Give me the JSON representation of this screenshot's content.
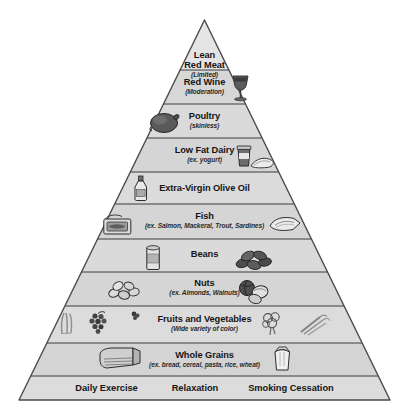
{
  "diagram": {
    "name": "Mediterranean-style healthy eating pyramid",
    "shape": "pyramid",
    "tier_count": 11,
    "colors": {
      "tier_fill": "#d6d6d6",
      "tier_fill_light": "#dcdcdc",
      "apex_fill": "#e4e4e4",
      "outline": "#4a4a4a",
      "divider": "#3c3c3c",
      "text": "#161616",
      "background": "#ffffff"
    }
  },
  "tiers": [
    {
      "index": 0,
      "title": "Lean\nRed Meat",
      "title_line1": "Lean",
      "title_line2": "Red Meat",
      "subtitle": "(Limited)",
      "icons": []
    },
    {
      "index": 1,
      "title": "Red Wine",
      "subtitle": "(Moderation)",
      "icons": [
        "wine-glass-icon"
      ]
    },
    {
      "index": 2,
      "title": "Poultry",
      "subtitle": "(skinless)",
      "icons": [
        "roast-chicken-icon"
      ]
    },
    {
      "index": 3,
      "title": "Low Fat Dairy",
      "subtitle": "(ex. yogurt)",
      "icons": [
        "yogurt-cup-icon",
        "cheese-wedge-icon"
      ]
    },
    {
      "index": 4,
      "title": "Extra-Virgin Olive Oil",
      "subtitle": "",
      "icons": [
        "olive-oil-bottle-icon"
      ]
    },
    {
      "index": 5,
      "title": "Fish",
      "subtitle": "(ex. Salmon, Mackeral, Trout, Sardines)",
      "icons": [
        "sardine-tin-icon",
        "fish-fillet-icon"
      ]
    },
    {
      "index": 6,
      "title": "Beans",
      "subtitle": "",
      "icons": [
        "bean-can-icon",
        "beans-pile-icon"
      ]
    },
    {
      "index": 7,
      "title": "Nuts",
      "subtitle": "(ex. Almonds, Walnuts)",
      "icons": [
        "almonds-icon",
        "walnuts-icon"
      ]
    },
    {
      "index": 8,
      "title": "Fruits and Vegetables",
      "subtitle": "(Wide variety of color)",
      "icons": [
        "celery-icon",
        "grapes-icon",
        "berry-icon",
        "broccoli-icon",
        "carrots-icon"
      ]
    },
    {
      "index": 9,
      "title": "Whole Grains",
      "subtitle": "(ex. bread, cereal, pasta, rice, wheat)",
      "icons": [
        "bread-loaf-icon",
        "rice-bag-icon"
      ]
    }
  ],
  "base": {
    "items": [
      {
        "label": "Daily Exercise"
      },
      {
        "label": "Relaxation"
      },
      {
        "label": "Smoking Cessation"
      }
    ]
  }
}
